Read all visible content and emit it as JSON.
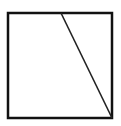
{
  "diagram": {
    "shape": "square-with-diagonal",
    "square": {
      "x": 8,
      "y": 13,
      "width": 104,
      "height": 105
    },
    "line": {
      "x1": 61,
      "y1": 13,
      "x2": 112,
      "y2": 118
    },
    "stroke_color": "#111111",
    "background": "#ffffff"
  }
}
